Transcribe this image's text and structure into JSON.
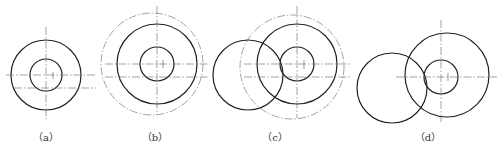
{
  "figures": [
    {
      "id": "a",
      "label": "（a）",
      "label_pos": [
        46,
        129
      ]
    },
    {
      "id": "b",
      "label": "（b）",
      "label_pos": [
        155,
        129
      ]
    },
    {
      "id": "c",
      "label": "（c）",
      "label_pos": [
        275,
        129
      ]
    },
    {
      "id": "d",
      "label": "（d）",
      "label_pos": [
        428,
        129
      ]
    }
  ],
  "colors": {
    "stroke": "#222222",
    "centerline": "#555555",
    "background": "#ffffff"
  }
}
